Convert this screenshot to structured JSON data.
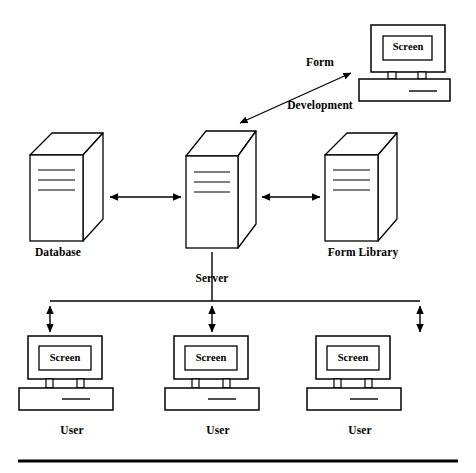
{
  "diagram": {
    "background_color": "#ffffff",
    "line_color": "#000000",
    "nodes": {
      "database": {
        "label": "Database",
        "type": "server-tower"
      },
      "server": {
        "label": "Server",
        "type": "server-tower"
      },
      "form_library": {
        "label": "Form Library",
        "type": "server-tower"
      },
      "form_development": {
        "label": "Form\nDevelopment",
        "label_line_1": "Form",
        "label_line_2": "Development",
        "type": "workstation",
        "screen_label": "Screen"
      },
      "user_1": {
        "label": "User",
        "type": "workstation",
        "screen_label": "Screen"
      },
      "user_2": {
        "label": "User",
        "type": "workstation",
        "screen_label": "Screen"
      },
      "user_3": {
        "label": "User",
        "type": "workstation",
        "screen_label": "Screen"
      }
    },
    "connections": [
      {
        "from": "database",
        "to": "server",
        "style": "double-arrow-horizontal"
      },
      {
        "from": "server",
        "to": "form_library",
        "style": "double-arrow-horizontal"
      },
      {
        "from": "server",
        "to": "form_development",
        "style": "double-arrow-diagonal"
      },
      {
        "from": "server",
        "to": "user_bus",
        "style": "line-vertical"
      },
      {
        "from": "user_bus",
        "to": "user_1",
        "style": "double-arrow-vertical"
      },
      {
        "from": "user_bus",
        "to": "user_2",
        "style": "double-arrow-vertical"
      },
      {
        "from": "user_bus",
        "to": "user_3",
        "style": "double-arrow-vertical"
      }
    ],
    "footer_rule": {
      "present": true,
      "thickness_px": 3
    }
  }
}
